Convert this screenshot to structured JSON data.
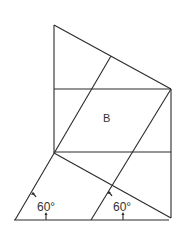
{
  "diagram": {
    "region_label": "B",
    "angles": [
      {
        "label": "60°",
        "x": 27,
        "y": 207
      },
      {
        "label": "60°",
        "x": 103,
        "y": 207
      }
    ]
  }
}
